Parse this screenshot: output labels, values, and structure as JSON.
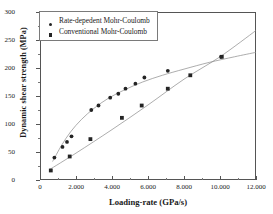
{
  "chart_data": {
    "type": "scatter",
    "title": "",
    "xlabel": "Loading-rate (GPa/s)",
    "ylabel": "Dynamic shear strength (MPa)",
    "xlim": [
      0,
      12000
    ],
    "ylim": [
      0,
      300
    ],
    "xticks": [
      0,
      2000,
      4000,
      6000,
      8000,
      10000,
      12000
    ],
    "xticklabels": [
      "0",
      "2.000",
      "4.000",
      "6.000",
      "8.000",
      "10.000",
      "12.000"
    ],
    "yticks": [
      0,
      50,
      100,
      150,
      200,
      250,
      300
    ],
    "yticklabels": [
      "0",
      "50",
      "100",
      "150",
      "200",
      "250",
      "300"
    ],
    "grid": false,
    "legend_position": "upper-left",
    "series": [
      {
        "name": "Rate-depedent Mohr-Coulomb",
        "marker": "circle",
        "color": "#242424",
        "points": [
          [
            800,
            40
          ],
          [
            1250,
            59
          ],
          [
            1500,
            68
          ],
          [
            1750,
            78
          ],
          [
            2850,
            125
          ],
          [
            3250,
            133
          ],
          [
            3900,
            147
          ],
          [
            4350,
            154
          ],
          [
            4750,
            163
          ],
          [
            5300,
            172
          ],
          [
            5800,
            183
          ],
          [
            7100,
            195
          ],
          [
            10050,
            220
          ]
        ],
        "fit_curve": [
          [
            700,
            33
          ],
          [
            1200,
            62
          ],
          [
            1700,
            86
          ],
          [
            2300,
            108
          ],
          [
            3000,
            128
          ],
          [
            3800,
            146
          ],
          [
            4700,
            161
          ],
          [
            5700,
            175
          ],
          [
            6800,
            187
          ],
          [
            8000,
            198
          ],
          [
            9400,
            210
          ],
          [
            10800,
            220
          ],
          [
            12000,
            228
          ]
        ]
      },
      {
        "name": "Conventional Mohr-Coulomb",
        "marker": "square",
        "color": "#242424",
        "points": [
          [
            600,
            17
          ],
          [
            1650,
            42
          ],
          [
            2800,
            73
          ],
          [
            4550,
            111
          ],
          [
            5650,
            133
          ],
          [
            7100,
            163
          ],
          [
            8350,
            187
          ],
          [
            10100,
            220
          ]
        ],
        "fit_curve": [
          [
            500,
            18
          ],
          [
            2000,
            48
          ],
          [
            4000,
            90
          ],
          [
            6000,
            134
          ],
          [
            8000,
            180
          ],
          [
            10000,
            220
          ],
          [
            12000,
            267
          ]
        ]
      }
    ]
  },
  "legend": {
    "items": [
      {
        "label": "Rate-depedent Mohr-Coulomb",
        "marker": "circle"
      },
      {
        "label": "Conventional Mohr-Coulomb",
        "marker": "square"
      }
    ]
  }
}
